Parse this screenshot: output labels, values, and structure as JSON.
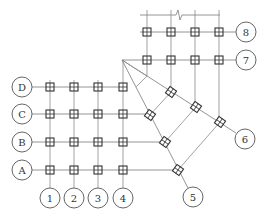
{
  "diagram": {
    "type": "structural-axis-grid-plan",
    "left_grid": {
      "columns": [
        {
          "label": "1",
          "x": 50
        },
        {
          "label": "2",
          "x": 74
        },
        {
          "label": "3",
          "x": 98
        },
        {
          "label": "4",
          "x": 123
        }
      ],
      "rows": [
        {
          "label": "D",
          "y": 87
        },
        {
          "label": "C",
          "y": 114
        },
        {
          "label": "B",
          "y": 142
        },
        {
          "label": "A",
          "y": 170
        }
      ]
    },
    "top_grid": {
      "columns_x": [
        147,
        171,
        195,
        219
      ],
      "rows": [
        {
          "label": "8",
          "y": 32
        },
        {
          "label": "7",
          "y": 60
        }
      ],
      "break_line_y": 15
    },
    "radial_axes": [
      {
        "label": "5",
        "bubble": [
          192,
          196
        ]
      },
      {
        "label": "6",
        "bubble": [
          245,
          139
        ]
      }
    ],
    "pivot": [
      122,
      60
    ],
    "colors": {
      "line": "#8a8a8a",
      "node": "#333333",
      "bubble_stroke": "#555555",
      "background": "#ffffff"
    }
  }
}
